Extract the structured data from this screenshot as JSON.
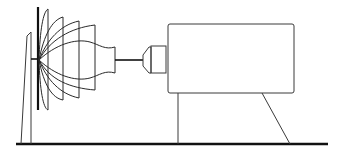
{
  "diagram": {
    "title": "",
    "components": [
      {
        "id": "ground-line",
        "label": ""
      },
      {
        "id": "screen-stand",
        "label": ""
      },
      {
        "id": "screen-plate",
        "label": ""
      },
      {
        "id": "beam-pattern",
        "label": ""
      },
      {
        "id": "connecting-rod",
        "label": ""
      },
      {
        "id": "lens",
        "label": ""
      },
      {
        "id": "device-body",
        "label": ""
      },
      {
        "id": "body-legs",
        "label": ""
      }
    ],
    "colors": {
      "line": "#111111",
      "background": "#ffffff"
    }
  }
}
